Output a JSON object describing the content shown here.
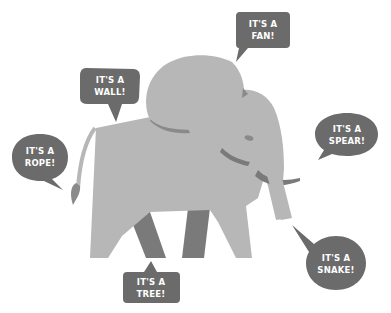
{
  "illustration": {
    "subject": "elephant",
    "colors": {
      "background": "#ffffff",
      "body": "#b7b7b7",
      "shadow": "#7a7a7a",
      "bubble": "#6b6b6b",
      "bubble_text": "#ffffff"
    }
  },
  "bubbles": {
    "fan": {
      "line1": "IT'S A",
      "line2": "FAN!"
    },
    "wall": {
      "line1": "IT'S A",
      "line2": "WALL!"
    },
    "rope": {
      "line1": "IT'S A",
      "line2": "ROPE!"
    },
    "spear": {
      "line1": "IT'S A",
      "line2": "SPEAR!"
    },
    "snake": {
      "line1": "IT'S A",
      "line2": "SNAKE!"
    },
    "tree": {
      "line1": "IT'S A",
      "line2": "TREE!"
    }
  }
}
